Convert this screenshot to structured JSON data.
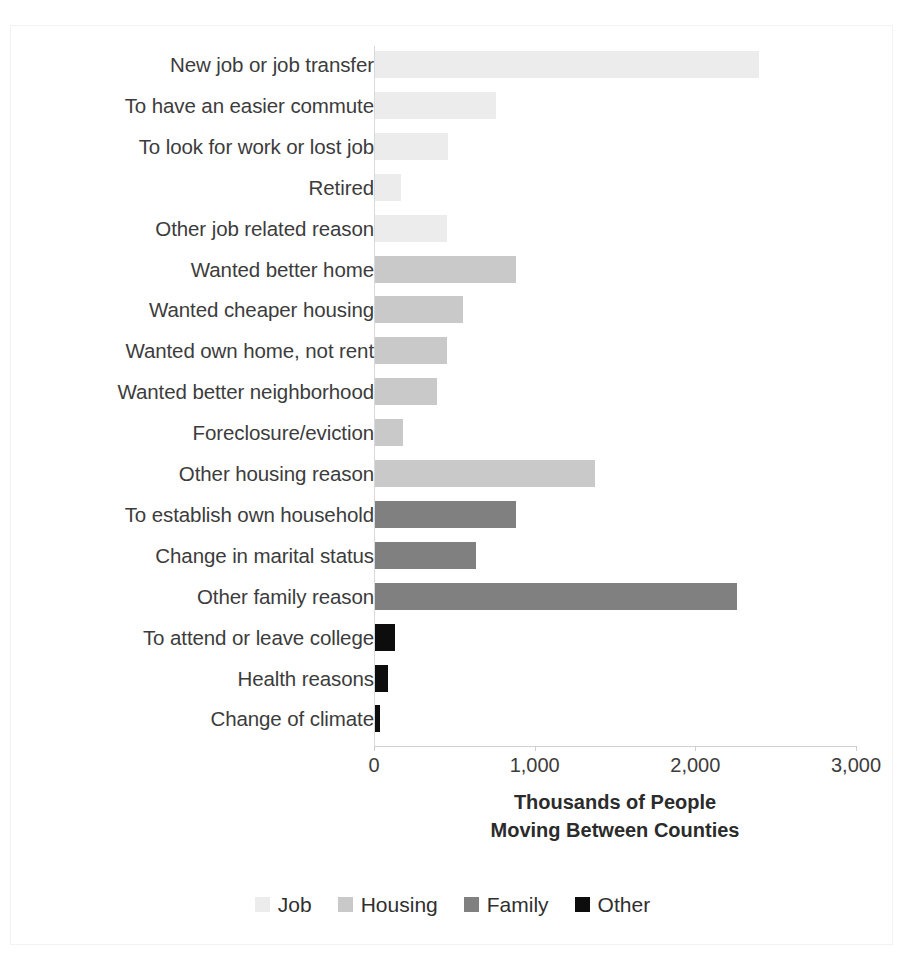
{
  "chart_data": {
    "type": "bar",
    "orientation": "horizontal",
    "title": "",
    "subtitle": "",
    "xlabel": "Thousands of People Moving Between Counties",
    "xlabel_lines": [
      "Thousands of People",
      "Moving Between Counties"
    ],
    "ylabel": "",
    "xlim": [
      0,
      3000
    ],
    "xticks": [
      0,
      1000,
      2000,
      3000
    ],
    "xtick_labels": [
      "0",
      "1,000",
      "2,000",
      "3,000"
    ],
    "grid": false,
    "legend_position": "bottom",
    "categories": [
      "New job or job transfer",
      "To have an easier commute",
      "To look for work or lost job",
      "Retired",
      "Other job related reason",
      "Wanted better home",
      "Wanted cheaper housing",
      "Wanted own home, not rent",
      "Wanted better neighborhood",
      "Foreclosure/eviction",
      "Other housing reason",
      "To establish own household",
      "Change in marital status",
      "Other family reason",
      "To attend or leave college",
      "Health reasons",
      "Change of climate"
    ],
    "values": [
      2390,
      750,
      455,
      160,
      450,
      880,
      545,
      450,
      385,
      175,
      1370,
      875,
      630,
      2250,
      125,
      80,
      30
    ],
    "groups": [
      "Job",
      "Job",
      "Job",
      "Job",
      "Job",
      "Housing",
      "Housing",
      "Housing",
      "Housing",
      "Housing",
      "Housing",
      "Family",
      "Family",
      "Family",
      "Other",
      "Other",
      "Other"
    ],
    "legend": [
      {
        "name": "Job",
        "color": "#ECECEC"
      },
      {
        "name": "Housing",
        "color": "#C9C9C9"
      },
      {
        "name": "Family",
        "color": "#808080"
      },
      {
        "name": "Other",
        "color": "#0D0D0D"
      }
    ],
    "group_colors": {
      "Job": "#ECECEC",
      "Housing": "#C9C9C9",
      "Family": "#808080",
      "Other": "#0D0D0D"
    }
  }
}
